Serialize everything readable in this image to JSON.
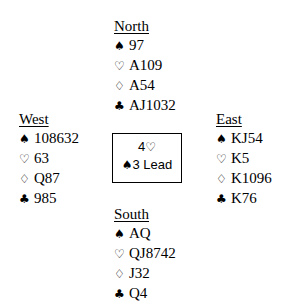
{
  "hands": {
    "north": {
      "name": "North",
      "spades": "97",
      "hearts": "A109",
      "diamonds": "A54",
      "clubs": "AJ1032"
    },
    "west": {
      "name": "West",
      "spades": "108632",
      "hearts": "63",
      "diamonds": "Q87",
      "clubs": "985"
    },
    "east": {
      "name": "East",
      "spades": "KJ54",
      "hearts": "K5",
      "diamonds": "K1096",
      "clubs": "K76"
    },
    "south": {
      "name": "South",
      "spades": "AQ",
      "hearts": "QJ8742",
      "diamonds": "J32",
      "clubs": "Q4"
    }
  },
  "symbols": {
    "spade": "♠",
    "heart": "♡",
    "diamond": "♢",
    "club": "♣"
  },
  "contract": {
    "level": "4",
    "strain_symbol": "♡",
    "lead_symbol": "♠",
    "lead_card": "3",
    "lead_label": "Lead"
  }
}
